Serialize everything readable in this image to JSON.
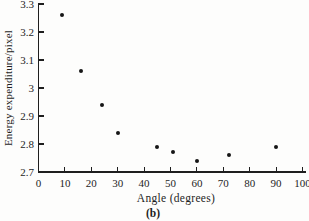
{
  "figure_label": "(b)",
  "colors": {
    "ink": "#1e1e1e",
    "marker": "#161616",
    "background": "#fdfdfc"
  },
  "chart_data": {
    "type": "scatter",
    "title": "",
    "xlabel": "Angle (degrees)",
    "ylabel": "Energy expenditure/pixel",
    "xlim": [
      0,
      100
    ],
    "ylim": [
      2.7,
      3.3
    ],
    "x_ticks": [
      0,
      10,
      20,
      30,
      40,
      50,
      60,
      70,
      80,
      90,
      100
    ],
    "x_tick_labels": [
      "0",
      "10",
      "20",
      "30",
      "40",
      "50",
      "60",
      "70",
      "80",
      "90",
      "100"
    ],
    "y_ticks": [
      2.7,
      2.8,
      2.9,
      3.0,
      3.1,
      3.2,
      3.3
    ],
    "y_tick_labels": [
      "2.7",
      "2.8",
      "2.9",
      "3",
      "3.1",
      "3.2",
      "3.3"
    ],
    "grid": false,
    "legend": null,
    "marker": "filled-circle",
    "points": [
      {
        "x": 9,
        "y": 3.26
      },
      {
        "x": 16,
        "y": 3.06
      },
      {
        "x": 24,
        "y": 2.94
      },
      {
        "x": 30,
        "y": 2.84
      },
      {
        "x": 45,
        "y": 2.79
      },
      {
        "x": 51,
        "y": 2.77
      },
      {
        "x": 60,
        "y": 2.74
      },
      {
        "x": 72,
        "y": 2.76
      },
      {
        "x": 90,
        "y": 2.79
      }
    ]
  }
}
